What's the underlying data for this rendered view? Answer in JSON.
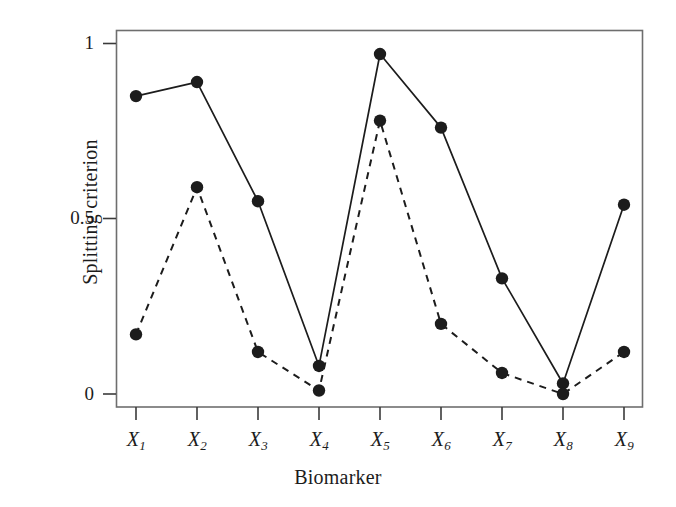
{
  "figure": {
    "background_color": "#ffffff",
    "frame_color": "#6e6e6e",
    "ink_color": "#1c1c1c"
  },
  "chart_data": {
    "type": "line",
    "title": "",
    "subtitle": "",
    "xlabel": "Biomarker",
    "ylabel": "Splitting criterion",
    "categories": [
      "X1",
      "X2",
      "X3",
      "X4",
      "X5",
      "X6",
      "X7",
      "X8",
      "X9"
    ],
    "category_labels": [
      {
        "base": "X",
        "sub": "1"
      },
      {
        "base": "X",
        "sub": "2"
      },
      {
        "base": "X",
        "sub": "3"
      },
      {
        "base": "X",
        "sub": "4"
      },
      {
        "base": "X",
        "sub": "5"
      },
      {
        "base": "X",
        "sub": "6"
      },
      {
        "base": "X",
        "sub": "7"
      },
      {
        "base": "X",
        "sub": "8"
      },
      {
        "base": "X",
        "sub": "9"
      }
    ],
    "series": [
      {
        "name": "solid",
        "linestyle": "solid",
        "color": "#1c1c1c",
        "marker": "filled-circle",
        "values": [
          0.85,
          0.89,
          0.55,
          0.08,
          0.97,
          0.76,
          0.33,
          0.03,
          0.54
        ]
      },
      {
        "name": "dashed",
        "linestyle": "dashed",
        "color": "#1c1c1c",
        "marker": "filled-circle",
        "values": [
          0.17,
          0.59,
          0.12,
          0.01,
          0.78,
          0.2,
          0.06,
          0.0,
          0.12
        ]
      }
    ],
    "ylim": [
      -0.0371,
      1.0371
    ],
    "yticks": [
      0,
      0.5,
      1
    ],
    "ytick_labels": [
      "0",
      "0.5",
      "1"
    ],
    "xlim": [
      0.5,
      9.5
    ],
    "grid": false,
    "legend": null
  }
}
